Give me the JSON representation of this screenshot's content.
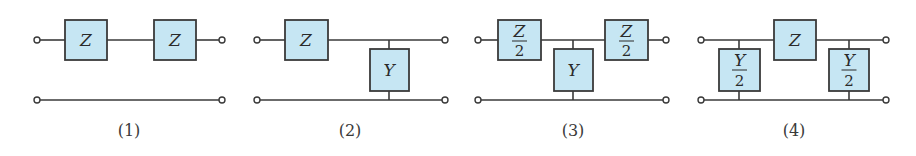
{
  "figure": {
    "colors": {
      "box_fill": "#c6e6f3",
      "line": "#3a3a3a",
      "text": "#2a2a2a"
    },
    "circuits": [
      {
        "caption": "(1)",
        "elements": [
          {
            "type": "series",
            "label": "Z"
          },
          {
            "type": "series",
            "label": "Z"
          }
        ]
      },
      {
        "caption": "(2)",
        "elements": [
          {
            "type": "series",
            "label": "Z"
          },
          {
            "type": "shunt",
            "label": "Y"
          }
        ]
      },
      {
        "caption": "(3)",
        "elements": [
          {
            "type": "series",
            "label_num": "Z",
            "label_den": "2"
          },
          {
            "type": "shunt",
            "label": "Y"
          },
          {
            "type": "series",
            "label_num": "Z",
            "label_den": "2"
          }
        ]
      },
      {
        "caption": "(4)",
        "elements": [
          {
            "type": "shunt",
            "label_num": "Y",
            "label_den": "2"
          },
          {
            "type": "series",
            "label": "Z"
          },
          {
            "type": "shunt",
            "label_num": "Y",
            "label_den": "2"
          }
        ]
      }
    ]
  }
}
